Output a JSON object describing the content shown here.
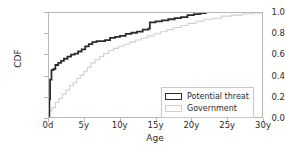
{
  "chart_data": {
    "type": "line",
    "title": "",
    "xlabel": "Age",
    "ylabel": "CDF",
    "xlim": [
      0,
      30
    ],
    "ylim": [
      0.0,
      1.0
    ],
    "grid": false,
    "legend_position": "lower right",
    "xtick_labels": [
      "0d",
      "5y",
      "10y",
      "15y",
      "20y",
      "25y",
      "30y"
    ],
    "xtick_values": [
      0,
      5,
      10,
      15,
      20,
      25,
      30
    ],
    "ytick_labels": [
      "0.0",
      "0.2",
      "0.4",
      "0.6",
      "0.8",
      "1.0"
    ],
    "ytick_values": [
      0.0,
      0.2,
      0.4,
      0.6,
      0.8,
      1.0
    ],
    "series": [
      {
        "name": "Potential threat",
        "color": "#2b2b2b",
        "linewidth": 1.8,
        "drawstyle": "steps-post",
        "x": [
          0.0,
          0.05,
          0.15,
          0.35,
          0.6,
          0.9,
          1.3,
          1.7,
          2.1,
          2.6,
          3.1,
          3.6,
          4.1,
          4.6,
          5.1,
          5.6,
          6.1,
          6.7,
          7.3,
          7.9,
          8.6,
          9.3,
          10.0,
          10.8,
          11.6,
          12.4,
          13.2,
          14.0,
          14.2,
          15.0,
          15.9,
          16.8,
          17.7,
          18.6,
          19.5,
          20.4,
          21.3,
          22.2
        ],
        "y": [
          0.0,
          0.17,
          0.36,
          0.45,
          0.46,
          0.5,
          0.52,
          0.54,
          0.56,
          0.58,
          0.6,
          0.61,
          0.63,
          0.65,
          0.68,
          0.7,
          0.72,
          0.73,
          0.73,
          0.74,
          0.76,
          0.77,
          0.78,
          0.8,
          0.81,
          0.82,
          0.84,
          0.85,
          0.91,
          0.92,
          0.93,
          0.94,
          0.95,
          0.96,
          0.98,
          0.99,
          1.0,
          1.0
        ]
      },
      {
        "name": "Government",
        "color": "#d0d0d0",
        "linewidth": 1.1,
        "drawstyle": "steps-post",
        "x": [
          0.0,
          0.05,
          0.4,
          0.9,
          1.4,
          1.9,
          2.4,
          2.9,
          3.4,
          3.9,
          4.4,
          4.9,
          5.4,
          5.9,
          6.5,
          7.1,
          7.7,
          8.4,
          9.1,
          9.8,
          10.6,
          11.4,
          12.2,
          13.0,
          13.9,
          14.8,
          15.7,
          16.6,
          17.6,
          18.6,
          19.6,
          20.7,
          21.8,
          23.0,
          24.3,
          25.7,
          27.2,
          28.8,
          30.0
        ],
        "y": [
          0.0,
          0.06,
          0.09,
          0.14,
          0.18,
          0.22,
          0.26,
          0.3,
          0.33,
          0.37,
          0.4,
          0.44,
          0.48,
          0.52,
          0.55,
          0.58,
          0.61,
          0.64,
          0.66,
          0.68,
          0.7,
          0.72,
          0.74,
          0.76,
          0.78,
          0.8,
          0.82,
          0.84,
          0.86,
          0.88,
          0.9,
          0.92,
          0.94,
          0.95,
          0.97,
          0.98,
          0.99,
          1.0,
          1.0
        ]
      }
    ]
  }
}
